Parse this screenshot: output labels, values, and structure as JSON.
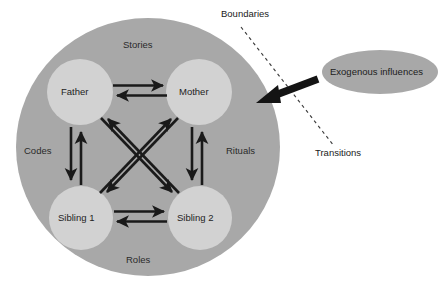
{
  "figure": {
    "type": "conceptual-diagram"
  },
  "system": {
    "container_name": "family-system-circle",
    "zone_labels": [
      {
        "key": "stories",
        "text": "Stories"
      },
      {
        "key": "codes",
        "text": "Codes"
      },
      {
        "key": "rituals",
        "text": "Rituals"
      },
      {
        "key": "roles",
        "text": "Roles"
      }
    ],
    "members": [
      {
        "key": "father",
        "label": "Father"
      },
      {
        "key": "mother",
        "label": "Mother"
      },
      {
        "key": "sibling-1",
        "label": "Sibling 1"
      },
      {
        "key": "sibling-2",
        "label": "Sibling 2"
      }
    ],
    "relations": [
      {
        "from": "father",
        "to": "mother",
        "direction": "bidirectional"
      },
      {
        "from": "father",
        "to": "sibling-1",
        "direction": "bidirectional"
      },
      {
        "from": "mother",
        "to": "sibling-2",
        "direction": "bidirectional"
      },
      {
        "from": "sibling-1",
        "to": "sibling-2",
        "direction": "bidirectional"
      },
      {
        "from": "father",
        "to": "sibling-2",
        "direction": "bidirectional"
      },
      {
        "from": "mother",
        "to": "sibling-1",
        "direction": "bidirectional"
      }
    ]
  },
  "external": {
    "influence_label": "Exogenous influences",
    "arrow_name": "exogenous-influence-arrow",
    "annotations": [
      {
        "key": "boundaries",
        "text": "Boundaries"
      },
      {
        "key": "transitions",
        "text": "Transitions"
      }
    ],
    "permeable_boundary_name": "permeable-boundary-dashed-line"
  },
  "colors": {
    "background": "#ffffff",
    "system_circle": "#a8a8a8",
    "member_circle": "#d0d0d0",
    "external_ellipse": "#a8a8a8",
    "arrow": "#1a1a1a",
    "dashed_line": "#444444",
    "text": "#1d1d1d"
  }
}
